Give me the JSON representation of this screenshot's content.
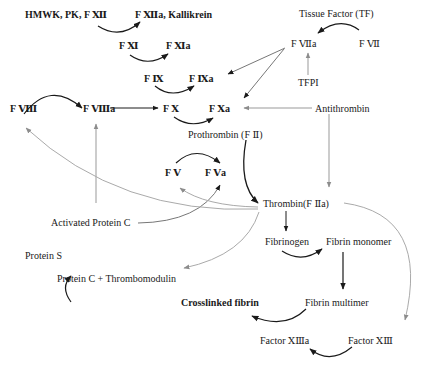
{
  "diagram": {
    "nodes": {
      "hmwk": "HMWK, PK, F Ⅻ",
      "f12a": "F Ⅻa, Kallikrein",
      "f11": "F Ⅺ",
      "f11a": "F Ⅺa",
      "f9": "F Ⅸ",
      "f9a": "F Ⅸa",
      "f8": "F Ⅷ",
      "f8a": "F Ⅷa",
      "f10": "F Ⅹ",
      "f10a": "F Ⅹa",
      "tf": "Tissue Factor (TF)",
      "f7a": "F Ⅶa",
      "f7": "F Ⅶ",
      "tfpi": "TFPI",
      "antithrombin": "Antithrombin",
      "prothrombin": "Prothrombin (F Ⅱ)",
      "f5": "F Ⅴ",
      "f5a": "F Ⅴa",
      "thrombin": "Thrombin(F Ⅱa)",
      "apc": "Activated Protein C",
      "proteinS": "Protein S",
      "pctm": "Protein C + Thrombomodulin",
      "fibrinogen": "Fibrinogen",
      "fibrinMonomer": "Fibrin monomer",
      "fibrinMultimer": "Fibrin multimer",
      "crosslinked": "Crosslinked fibrin",
      "f13": "Factor ⅩⅢ",
      "f13a": "Factor ⅩⅢa"
    },
    "edges": [
      {
        "from": "hmwk",
        "to": "f12a",
        "style": "activation"
      },
      {
        "from": "f11",
        "to": "f11a",
        "style": "activation"
      },
      {
        "from": "f9",
        "to": "f9a",
        "style": "activation"
      },
      {
        "from": "f8",
        "to": "f8a",
        "style": "activation"
      },
      {
        "from": "f8a",
        "to": "f10",
        "style": "activation"
      },
      {
        "from": "f10",
        "to": "f10a",
        "style": "activation"
      },
      {
        "from": "f7",
        "to": "f7a",
        "style": "activation",
        "via": "tf"
      },
      {
        "from": "f7a",
        "to": "f9a",
        "style": "activation"
      },
      {
        "from": "f7a",
        "to": "f10a",
        "style": "activation"
      },
      {
        "from": "tfpi",
        "to": "f7a",
        "style": "inhibition"
      },
      {
        "from": "antithrombin",
        "to": "f10a",
        "style": "inhibition"
      },
      {
        "from": "antithrombin",
        "to": "thrombin",
        "style": "inhibition"
      },
      {
        "from": "prothrombin",
        "to": "thrombin",
        "style": "activation"
      },
      {
        "from": "f5",
        "to": "f5a",
        "style": "activation"
      },
      {
        "from": "thrombin",
        "to": "f8",
        "style": "feedback"
      },
      {
        "from": "thrombin",
        "to": "f5",
        "style": "feedback"
      },
      {
        "from": "thrombin",
        "to": "pctm",
        "style": "feedback"
      },
      {
        "from": "thrombin",
        "to": "f13",
        "style": "feedback"
      },
      {
        "from": "apc",
        "to": "f8a",
        "style": "inhibition"
      },
      {
        "from": "apc",
        "to": "f5a",
        "style": "inhibition"
      },
      {
        "from": "pctm",
        "to": "apc",
        "style": "activation",
        "via": "proteinS"
      },
      {
        "from": "thrombin",
        "to": "fibrinogen",
        "style": "activation"
      },
      {
        "from": "fibrinogen",
        "to": "fibrinMonomer",
        "style": "activation"
      },
      {
        "from": "fibrinMonomer",
        "to": "fibrinMultimer",
        "style": "activation"
      },
      {
        "from": "fibrinMultimer",
        "to": "crosslinked",
        "style": "activation"
      },
      {
        "from": "f13",
        "to": "f13a",
        "style": "activation"
      }
    ],
    "colors": {
      "activation": "#1a1a1a",
      "feedback": "#9a9a9a",
      "text": "#1a1a1a"
    }
  }
}
